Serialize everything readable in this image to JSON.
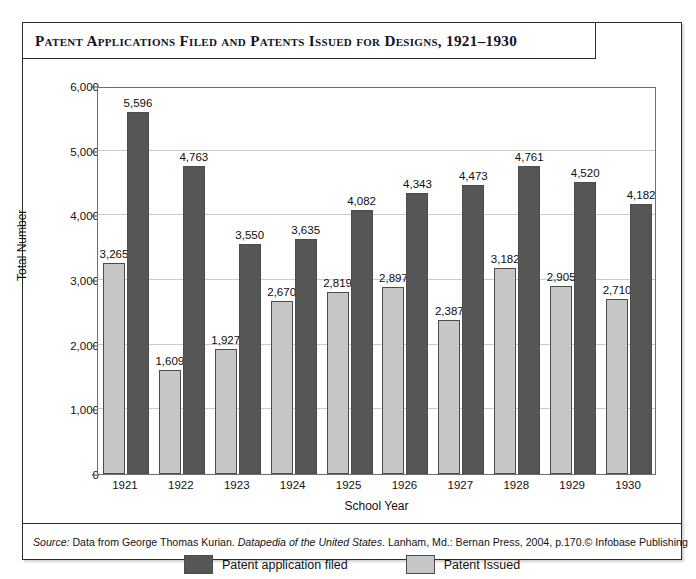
{
  "figure": {
    "title": "Patent Applications Filed and Patents Issued for Designs, 1921–1930",
    "source_prefix": "Source:",
    "source_text_1": " Data from George Thomas Kurian. ",
    "source_italic": "Datapedia of the United States",
    "source_text_2": ". Lanham, Md.: Bernan Press, 2004, p.170.",
    "copyright": "© Infobase Publishing"
  },
  "legend": {
    "items": [
      {
        "label": "Patent application filed",
        "color": "#565656",
        "swatch": "dark"
      },
      {
        "label": "Patent Issued",
        "color": "#c6c6c6",
        "swatch": "light"
      }
    ]
  },
  "chart_data": {
    "type": "bar",
    "title": "Patent Applications Filed and Patents Issued for Designs, 1921–1930",
    "xlabel": "School Year",
    "ylabel": "Total Number",
    "categories": [
      "1921",
      "1922",
      "1923",
      "1924",
      "1925",
      "1926",
      "1927",
      "1928",
      "1929",
      "1930"
    ],
    "ylim": [
      0,
      6000
    ],
    "yticks": [
      0,
      1000,
      2000,
      3000,
      4000,
      5000,
      6000
    ],
    "ytick_labels": [
      "0",
      "1,000",
      "2,000",
      "3,000",
      "4,000",
      "5,000",
      "6,000"
    ],
    "grid": true,
    "legend_position": "bottom",
    "bar_order": [
      "Patent Issued",
      "Patent application filed"
    ],
    "series": [
      {
        "name": "Patent Issued",
        "color": "#c6c6c6",
        "values": [
          3265,
          1609,
          1927,
          2670,
          2819,
          2897,
          2387,
          3182,
          2905,
          2710
        ],
        "value_labels": [
          "3,265",
          "1,609",
          "1,927",
          "2,670",
          "2,819",
          "2,897",
          "2,387",
          "3,182",
          "2,905",
          "2,710"
        ]
      },
      {
        "name": "Patent application filed",
        "color": "#565656",
        "values": [
          5596,
          4763,
          3550,
          3635,
          4082,
          4343,
          4473,
          4761,
          4520,
          4182
        ],
        "value_labels": [
          "5,596",
          "4,763",
          "3,550",
          "3,635",
          "4,082",
          "4,343",
          "4,473",
          "4,761",
          "4,520",
          "4,182"
        ]
      }
    ]
  }
}
